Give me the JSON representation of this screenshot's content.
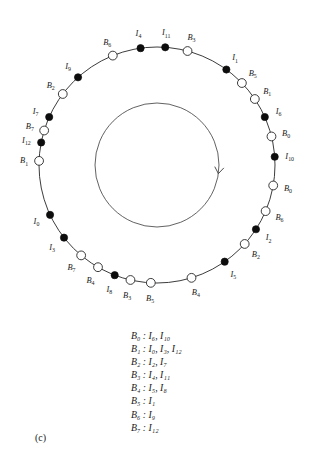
{
  "figure": {
    "caption": "(c)",
    "center_x": 157,
    "center_y": 165,
    "outer_radius": 118,
    "inner_radius": 62,
    "node_radius_filled": 3.6,
    "node_radius_open": 4.4,
    "label_offset": 15,
    "colors": {
      "stroke": "#262626",
      "filled_node": "#0d0d0d",
      "open_node": "#ffffff",
      "text": "#1a1a1a",
      "inner_ring": "#3a3a3a"
    },
    "rotation_direction": "clockwise",
    "arrow_angle_deg": 8
  },
  "ring_nodes": [
    {
      "label": "B",
      "sub": "1",
      "type": "open",
      "angle": 272
    },
    {
      "label": "I",
      "sub": "12",
      "type": "filled",
      "angle": 281
    },
    {
      "label": "B",
      "sub": "7",
      "type": "open",
      "angle": 287
    },
    {
      "label": "I",
      "sub": "7",
      "type": "filled",
      "angle": 294
    },
    {
      "label": "B",
      "sub": "2",
      "type": "open",
      "angle": 307
    },
    {
      "label": "I",
      "sub": "9",
      "type": "filled",
      "angle": 318
    },
    {
      "label": "B",
      "sub": "6",
      "type": "open",
      "angle": 338
    },
    {
      "label": "I",
      "sub": "4",
      "type": "filled",
      "angle": 352
    },
    {
      "label": "I",
      "sub": "11",
      "type": "filled",
      "angle": 4
    },
    {
      "label": "B",
      "sub": "3",
      "type": "open",
      "angle": 15
    },
    {
      "label": "I",
      "sub": "1",
      "type": "filled",
      "angle": 36
    },
    {
      "label": "B",
      "sub": "5",
      "type": "open",
      "angle": 46
    },
    {
      "label": "B",
      "sub": "1",
      "type": "open",
      "angle": 56
    },
    {
      "label": "I",
      "sub": "6",
      "type": "filled",
      "angle": 66
    },
    {
      "label": "B",
      "sub": "0",
      "type": "open",
      "angle": 76
    },
    {
      "label": "I",
      "sub": "10",
      "type": "filled",
      "angle": 86
    },
    {
      "label": "B",
      "sub": "0",
      "type": "open",
      "angle": 100
    },
    {
      "label": "B",
      "sub": "6",
      "type": "open",
      "angle": 113
    },
    {
      "label": "I",
      "sub": "2",
      "type": "filled",
      "angle": 123
    },
    {
      "label": "B",
      "sub": "2",
      "type": "open",
      "angle": 132
    },
    {
      "label": "I",
      "sub": "5",
      "type": "filled",
      "angle": 145
    },
    {
      "label": "B",
      "sub": "4",
      "type": "open",
      "angle": 163
    },
    {
      "label": "B",
      "sub": "5",
      "type": "open",
      "angle": 183
    },
    {
      "label": "B",
      "sub": "3",
      "type": "open",
      "angle": 193
    },
    {
      "label": "I",
      "sub": "8",
      "type": "filled",
      "angle": 201
    },
    {
      "label": "B",
      "sub": "4",
      "type": "open",
      "angle": 210
    },
    {
      "label": "B",
      "sub": "7",
      "type": "open",
      "angle": 220
    },
    {
      "label": "I",
      "sub": "3",
      "type": "filled",
      "angle": 232
    },
    {
      "label": "I",
      "sub": "0",
      "type": "filled",
      "angle": 245
    },
    {
      "label": "B",
      "sub": "1b",
      "type": "hidden",
      "angle": 259
    }
  ],
  "legend": {
    "entries": [
      {
        "bucket": "B",
        "bucket_sub": "0",
        "items": "I₆, I₁₀",
        "text": "B₀ : I₆, I₁₀"
      },
      {
        "bucket": "B",
        "bucket_sub": "1",
        "items": "I₀, I₃, I₁₂",
        "text": "B₁ : I₀, I₃, I₁₂"
      },
      {
        "bucket": "B",
        "bucket_sub": "2",
        "items": "I₂, I₇",
        "text": "B₂ : I₂, I₇"
      },
      {
        "bucket": "B",
        "bucket_sub": "3",
        "items": "I₄, I₁₁",
        "text": "B₃ : I₄, I₁₁"
      },
      {
        "bucket": "B",
        "bucket_sub": "4",
        "items": "I₅, I₈",
        "text": "B₄ : I₅, I₈"
      },
      {
        "bucket": "B",
        "bucket_sub": "5",
        "items": "I₁",
        "text": "B₅ : I₁"
      },
      {
        "bucket": "B",
        "bucket_sub": "6",
        "items": "I₉",
        "text": "B₆ : I₉"
      },
      {
        "bucket": "B",
        "bucket_sub": "7",
        "items": "I₁₂",
        "text": "B₇ : I₁₂"
      }
    ]
  }
}
